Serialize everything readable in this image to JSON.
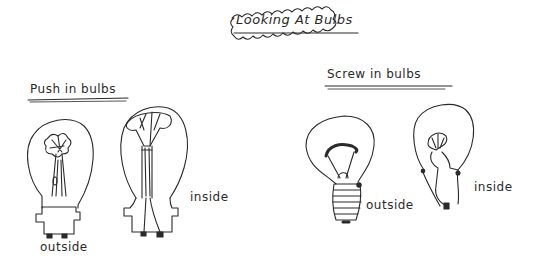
{
  "title": "Looking At Bulbs",
  "sections": [
    {
      "heading": "Push in bulbs",
      "bulbs": [
        {
          "type": "push-in",
          "view": "outside",
          "label": "outside"
        },
        {
          "type": "push-in",
          "view": "inside",
          "label": "inside"
        }
      ]
    },
    {
      "heading": "Screw in bulbs",
      "bulbs": [
        {
          "type": "screw-in",
          "view": "outside",
          "label": "outside"
        },
        {
          "type": "screw-in",
          "view": "inside",
          "label": "inside"
        }
      ]
    }
  ],
  "colors": {
    "ink": "#2a2a2a",
    "background": "#ffffff"
  }
}
